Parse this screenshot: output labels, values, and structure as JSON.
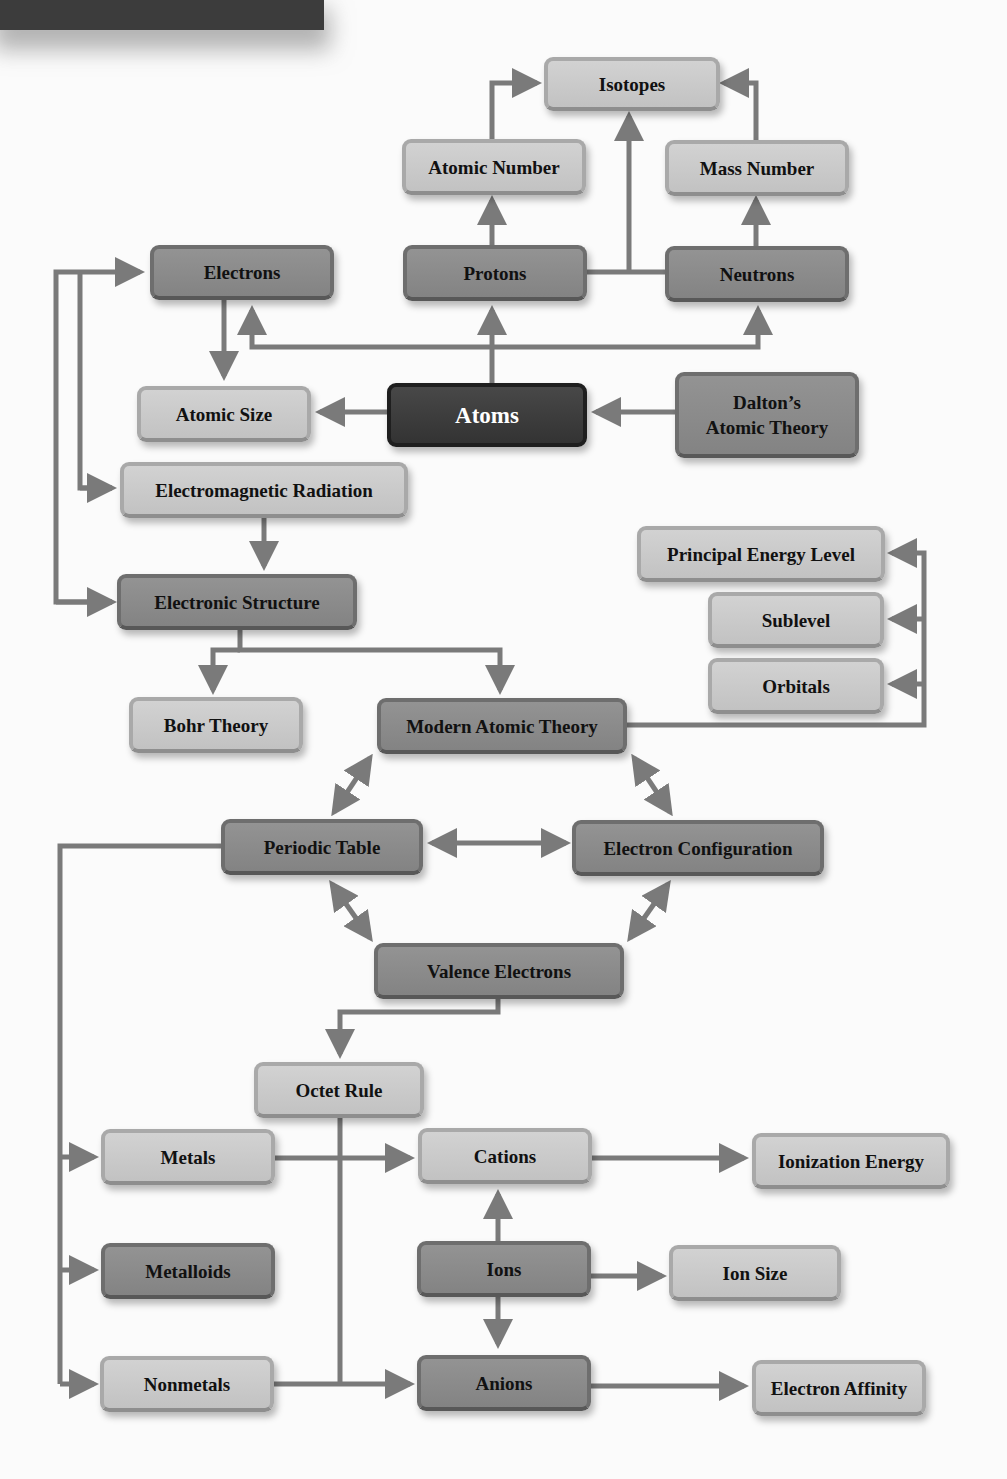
{
  "nodes": {
    "isotopes": "Isotopes",
    "atomic_number": "Atomic Number",
    "mass_number": "Mass Number",
    "electrons": "Electrons",
    "protons": "Protons",
    "neutrons": "Neutrons",
    "atomic_size": "Atomic Size",
    "atoms": "Atoms",
    "daltons_line1": "Dalton’s",
    "daltons_line2": "Atomic Theory",
    "electromagnetic_radiation": "Electromagnetic Radiation",
    "electronic_structure": "Electronic Structure",
    "principal_energy_level": "Principal Energy Level",
    "sublevel": "Sublevel",
    "orbitals": "Orbitals",
    "bohr_theory": "Bohr Theory",
    "modern_atomic_theory": "Modern Atomic Theory",
    "periodic_table": "Periodic Table",
    "electron_configuration": "Electron Configuration",
    "valence_electrons": "Valence Electrons",
    "octet_rule": "Octet Rule",
    "metals": "Metals",
    "cations": "Cations",
    "ionization_energy": "Ionization Energy",
    "metalloids": "Metalloids",
    "ions": "Ions",
    "ion_size": "Ion Size",
    "nonmetals": "Nonmetals",
    "anions": "Anions",
    "electron_affinity": "Electron Affinity"
  },
  "colors": {
    "light_box": "#c8c8c8",
    "medium_box": "#8c8c8c",
    "dark_box": "#3d3d3d",
    "connector": "#7a7a7a",
    "background": "#fbfbfb"
  }
}
